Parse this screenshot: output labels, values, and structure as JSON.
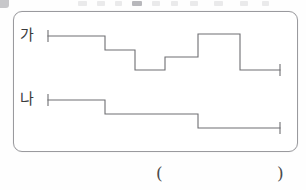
{
  "page": {
    "background_color": "#ffffff",
    "stroke_color": "#6e6e72",
    "panel_border_color": "#9a9a9e"
  },
  "panel": {
    "name": "step-graph-panel",
    "rows": [
      {
        "id": "ga",
        "label": "가",
        "end_cap_left": true,
        "end_cap_right": true,
        "segments": [
          {
            "x1": 48,
            "x2": 105,
            "y": 36
          },
          {
            "x1": 105,
            "x2": 135,
            "y": 50
          },
          {
            "x1": 135,
            "x2": 165,
            "y": 70
          },
          {
            "x1": 165,
            "x2": 198,
            "y": 57
          },
          {
            "x1": 198,
            "x2": 240,
            "y": 34
          },
          {
            "x1": 240,
            "x2": 280,
            "y": 70
          }
        ]
      },
      {
        "id": "na",
        "label": "나",
        "end_cap_left": true,
        "end_cap_right": true,
        "segments": [
          {
            "x1": 48,
            "x2": 105,
            "y": 100
          },
          {
            "x1": 105,
            "x2": 198,
            "y": 114
          },
          {
            "x1": 198,
            "x2": 280,
            "y": 128
          }
        ]
      }
    ]
  },
  "answer": {
    "open_paren": "(",
    "close_paren": ")",
    "value": ""
  },
  "top_artifact": {
    "description": "cut-off text row from preceding page content"
  }
}
